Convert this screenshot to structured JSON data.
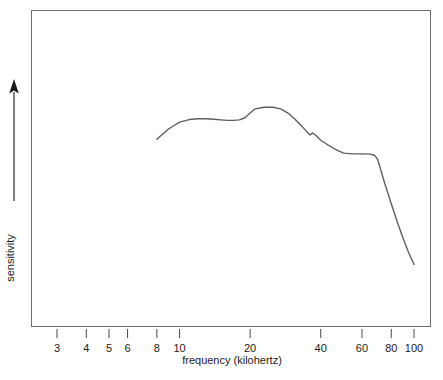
{
  "chart_data": {
    "type": "line",
    "title": "",
    "xlabel": "frequency (kilohertz)",
    "ylabel": "sensitivity",
    "xscale": "log",
    "xlim": [
      2.3,
      118
    ],
    "ylim": [
      0,
      1
    ],
    "grid": false,
    "legend": null,
    "x_tick_labels": [
      "3",
      "4",
      "5",
      "6",
      "8",
      "10",
      "20",
      "40",
      "60",
      "80",
      "100"
    ],
    "x_tick_values": [
      3,
      4,
      5,
      6,
      8,
      10,
      20,
      40,
      60,
      80,
      100
    ],
    "y_tick_labels": [],
    "y_axis_style": "arrow-only (unlabeled, increasing upward)",
    "series": [
      {
        "name": "sensitivity",
        "color": "#5f5f63",
        "x": [
          8,
          9,
          10,
          11,
          12,
          13,
          14,
          15,
          16,
          17,
          18,
          19,
          20,
          21,
          23,
          25,
          27,
          29,
          31,
          33,
          35,
          36,
          37,
          38,
          40,
          43,
          46,
          50,
          55,
          60,
          65,
          68,
          70,
          72,
          75,
          80,
          85,
          90,
          95,
          100
        ],
        "y": [
          0.69,
          0.73,
          0.755,
          0.765,
          0.768,
          0.768,
          0.766,
          0.764,
          0.762,
          0.762,
          0.764,
          0.772,
          0.79,
          0.806,
          0.812,
          0.812,
          0.806,
          0.79,
          0.767,
          0.742,
          0.718,
          0.706,
          0.714,
          0.706,
          0.686,
          0.668,
          0.652,
          0.637,
          0.634,
          0.634,
          0.633,
          0.628,
          0.612,
          0.576,
          0.522,
          0.444,
          0.372,
          0.31,
          0.256,
          0.212
        ]
      }
    ]
  },
  "axes": {
    "x_label": "frequency (kilohertz)",
    "y_label": "sensitivity"
  },
  "icons": {
    "y_axis_arrow": "up-arrow-icon"
  }
}
